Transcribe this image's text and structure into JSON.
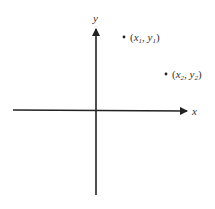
{
  "diagram": {
    "type": "cartesian-plane",
    "axes": {
      "x_label": "x",
      "y_label": "y",
      "color": "#222222"
    },
    "points": [
      {
        "label_open": "(",
        "var1": "x",
        "sub1": "1",
        "sep": ", ",
        "var2": "y",
        "sub2": "1",
        "label_close": ")"
      },
      {
        "label_open": "(",
        "var1": "x",
        "sub1": "2",
        "sep": ", ",
        "var2": "y",
        "sub2": "2",
        "label_close": ")"
      }
    ]
  }
}
